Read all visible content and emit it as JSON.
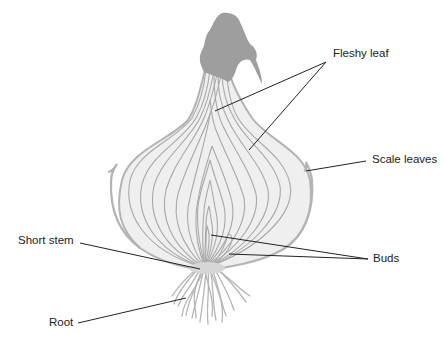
{
  "diagram": {
    "colors": {
      "background": "#ffffff",
      "bulb_fill": "#efefef",
      "bulb_outline": "#b3b3b3",
      "leaf_lines": "#a8a8a8",
      "dry_tip": "#9e9e9e",
      "roots": "#b5b5b5",
      "leader_lines": "#222222",
      "label_text": "#222222"
    },
    "labels": [
      {
        "id": "fleshy-leaf",
        "text": "Fleshy leaf",
        "x": 333,
        "y": 48
      },
      {
        "id": "scale-leaves",
        "text": "Scale leaves",
        "x": 372,
        "y": 154
      },
      {
        "id": "short-stem",
        "text": "Short stem",
        "x": 18,
        "y": 235
      },
      {
        "id": "buds",
        "text": "Buds",
        "x": 373,
        "y": 253
      },
      {
        "id": "root",
        "text": "Root",
        "x": 49,
        "y": 317
      }
    ]
  }
}
